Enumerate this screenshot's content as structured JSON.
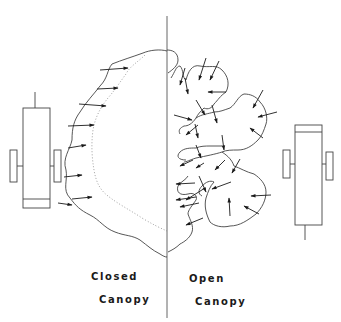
{
  "diagram": {
    "left_panel": {
      "label_line1": "Closed",
      "label_line2": "Canopy"
    },
    "right_panel": {
      "label_line1": "Open",
      "label_line2": "Canopy"
    },
    "colors": {
      "line": "#3a3a3a",
      "arrow": "#1a1a1a",
      "background": "#ffffff"
    }
  }
}
